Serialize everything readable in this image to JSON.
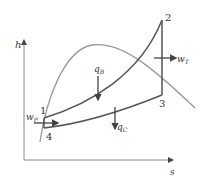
{
  "diagram": {
    "type": "h-s diagram (Rankine cycle)",
    "axes": {
      "y_label": "h",
      "x_label": "s"
    },
    "points": [
      {
        "id": "1",
        "label": "1"
      },
      {
        "id": "2",
        "label": "2"
      },
      {
        "id": "3",
        "label": "3"
      },
      {
        "id": "4",
        "label": "4"
      }
    ],
    "energy_flows": {
      "pump_work": {
        "symbol": "w",
        "subscript": "P"
      },
      "boiler_heat": {
        "symbol": "q",
        "subscript": "B"
      },
      "turbine_work": {
        "symbol": "w",
        "subscript": "T"
      },
      "condenser_heat": {
        "symbol": "q",
        "subscript": "C"
      }
    },
    "colors": {
      "cycle": "#555555",
      "saturation_dome": "#888888",
      "axes": "#777777",
      "arrows": "#444444"
    }
  }
}
